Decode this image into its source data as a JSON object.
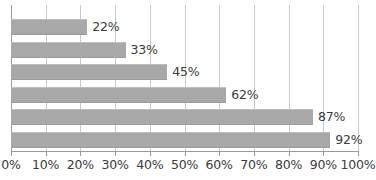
{
  "chart_data": {
    "type": "bar",
    "orientation": "horizontal",
    "title": "",
    "subtitle": "",
    "xlabel": "",
    "ylabel": "",
    "categories": [
      "",
      "",
      "",
      "",
      "",
      ""
    ],
    "values": [
      22,
      33,
      45,
      62,
      87,
      92
    ],
    "data_labels": [
      "22%",
      "33%",
      "45%",
      "62%",
      "87%",
      "92%"
    ],
    "xlim": [
      0,
      100
    ],
    "xticks": [
      0,
      10,
      20,
      30,
      40,
      50,
      60,
      70,
      80,
      90,
      100
    ],
    "xtick_labels": [
      "0%",
      "10%",
      "20%",
      "30%",
      "40%",
      "50%",
      "60%",
      "70%",
      "80%",
      "90%",
      "100%"
    ],
    "grid": true,
    "grid_axis": "x",
    "legend": false,
    "legend_position": "none",
    "bar_color": "#a8a8a8",
    "gridline_color": "#c8c8c8",
    "axis_color": "#9a9a9a",
    "label_color": "#3b3b3b",
    "background": "#ffffff"
  }
}
